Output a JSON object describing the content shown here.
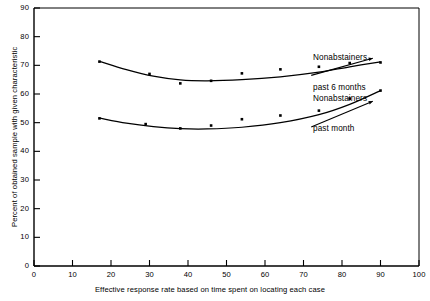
{
  "chart_data": {
    "type": "line",
    "title": "",
    "xlabel": "Effective response rate based on time spent on locating each case",
    "ylabel": "Percent of obtained sample with given characteristic",
    "xlim": [
      0,
      100
    ],
    "ylim": [
      0,
      90
    ],
    "xticks": [
      0,
      10,
      20,
      30,
      40,
      50,
      60,
      70,
      80,
      90,
      100
    ],
    "yticks": [
      0,
      10,
      20,
      30,
      40,
      50,
      60,
      70,
      80,
      90
    ],
    "grid": false,
    "legend": "inline-annotations",
    "line_color": "#000000",
    "marker_color": "#000000",
    "series": [
      {
        "name": "Nonabstainers past 6 months",
        "annotation": "Nonabstainers\npast 6 months",
        "annotation_line1": "Nonabstainers",
        "annotation_line2": "past 6 months",
        "points": [
          {
            "x": 17,
            "y": 71.3
          },
          {
            "x": 30,
            "y": 67.0
          },
          {
            "x": 38,
            "y": 63.7
          },
          {
            "x": 46,
            "y": 64.6
          },
          {
            "x": 54,
            "y": 67.2
          },
          {
            "x": 64,
            "y": 68.6
          },
          {
            "x": 74,
            "y": 69.5
          },
          {
            "x": 82,
            "y": 70.8
          },
          {
            "x": 90,
            "y": 71.0
          }
        ],
        "curve": [
          {
            "x": 17,
            "y": 71.4
          },
          {
            "x": 24,
            "y": 68.5
          },
          {
            "x": 31,
            "y": 66.2
          },
          {
            "x": 38,
            "y": 64.9
          },
          {
            "x": 45,
            "y": 64.6
          },
          {
            "x": 54,
            "y": 65.0
          },
          {
            "x": 64,
            "y": 66.0
          },
          {
            "x": 74,
            "y": 67.6
          },
          {
            "x": 82,
            "y": 69.5
          },
          {
            "x": 90,
            "y": 71.2
          }
        ]
      },
      {
        "name": "Nonabstainers past month",
        "annotation": "Nonabstainers\npast month",
        "annotation_line1": "Nonabstainers",
        "annotation_line2": "past month",
        "points": [
          {
            "x": 17,
            "y": 51.5
          },
          {
            "x": 29,
            "y": 49.5
          },
          {
            "x": 38,
            "y": 48.0
          },
          {
            "x": 46,
            "y": 49.0
          },
          {
            "x": 54,
            "y": 51.2
          },
          {
            "x": 64,
            "y": 52.5
          },
          {
            "x": 74,
            "y": 54.2
          },
          {
            "x": 82,
            "y": 58.4
          },
          {
            "x": 90,
            "y": 61.2
          }
        ],
        "curve": [
          {
            "x": 17,
            "y": 51.6
          },
          {
            "x": 24,
            "y": 49.8
          },
          {
            "x": 31,
            "y": 48.6
          },
          {
            "x": 38,
            "y": 47.9
          },
          {
            "x": 45,
            "y": 47.8
          },
          {
            "x": 54,
            "y": 48.4
          },
          {
            "x": 64,
            "y": 50.0
          },
          {
            "x": 74,
            "y": 52.8
          },
          {
            "x": 82,
            "y": 56.4
          },
          {
            "x": 90,
            "y": 61.2
          }
        ]
      }
    ],
    "annotations": [
      {
        "line1": "Nonabstainers",
        "line2": "past 6 months",
        "leader": {
          "x1": 72,
          "y1": 66.5,
          "x2": 88,
          "y2": 72.5
        }
      },
      {
        "line1": "Nonabstainers",
        "line2": "past month",
        "leader": {
          "x1": 72,
          "y1": 48.5,
          "x2": 88,
          "y2": 57.5
        }
      }
    ]
  }
}
